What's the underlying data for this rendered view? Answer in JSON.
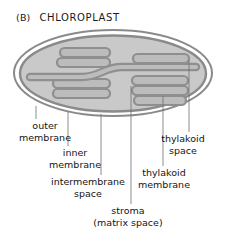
{
  "figure": {
    "panel_letter": "(B)",
    "title": "CHLOROPLAST",
    "colors": {
      "background": "#ffffff",
      "stroma_fill": "#c9c9c9",
      "membrane_stroke": "#8a8a8a",
      "thylakoid_stroke": "#8f8f8f",
      "thylakoid_fill": "#bcbcbc",
      "leader_line": "#6e6e6e",
      "text": "#141414"
    }
  },
  "labels": {
    "outer_membrane": "outer\nmembrane",
    "outer_membrane_l1": "outer",
    "outer_membrane_l2": "membrane",
    "inner_membrane_l1": "inner",
    "inner_membrane_l2": "membrane",
    "intermembrane_space_l1": "intermembrane",
    "intermembrane_space_l2": "space",
    "stroma_l1": "stroma",
    "stroma_l2": "(matrix space)",
    "thylakoid_membrane_l1": "thylakoid",
    "thylakoid_membrane_l2": "membrane",
    "thylakoid_space_l1": "thylakoid",
    "thylakoid_space_l2": "space"
  },
  "structures": {
    "outer_membrane": "outer membrane",
    "inner_membrane": "inner membrane",
    "intermembrane_space": "intermembrane space",
    "stroma": "stroma",
    "granum_left": "granum (thylakoid stack, left)",
    "granum_right": "granum (thylakoid stack, right)",
    "stroma_lamella": "stroma lamella",
    "thylakoid_disc_count_left": 3,
    "thylakoid_disc_count_right": 3
  }
}
